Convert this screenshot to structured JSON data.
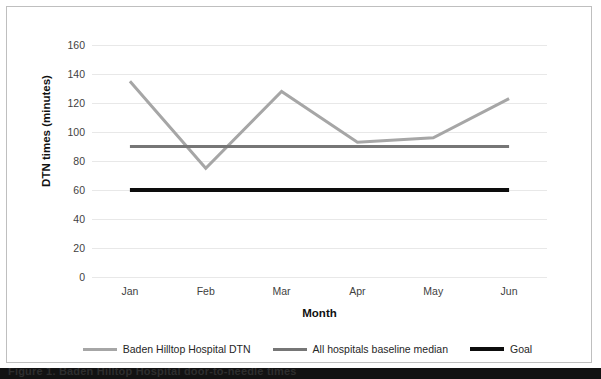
{
  "chart_data": {
    "type": "line",
    "title": "",
    "xlabel": "Month",
    "ylabel": "DTN times (minutes)",
    "categories": [
      "Jan",
      "Feb",
      "Mar",
      "Apr",
      "May",
      "Jun"
    ],
    "ylim": [
      0,
      160
    ],
    "ytick_step": 20,
    "yticks": [
      160,
      140,
      120,
      100,
      80,
      60,
      40,
      20,
      0
    ],
    "grid": "horizontal",
    "legend_position": "bottom",
    "series": [
      {
        "name": "Baden Hilltop Hospital DTN",
        "color": "#a6a6a6",
        "width": 3,
        "values": [
          135,
          75,
          128,
          93,
          96,
          123
        ]
      },
      {
        "name": "All hospitals baseline median",
        "color": "#767676",
        "width": 3,
        "values": [
          90,
          90,
          90,
          90,
          90,
          90
        ]
      },
      {
        "name": "Goal",
        "color": "#0d0d0d",
        "width": 4,
        "values": [
          60,
          60,
          60,
          60,
          60,
          60
        ]
      }
    ]
  },
  "legend": {
    "items": [
      {
        "label": "Baden Hilltop Hospital DTN",
        "color": "#a6a6a6",
        "weight": "normal"
      },
      {
        "label": "All hospitals baseline median",
        "color": "#767676",
        "weight": "normal"
      },
      {
        "label": "Goal",
        "color": "#0d0d0d",
        "weight": "thick"
      }
    ]
  },
  "caption": {
    "text": "Figure 1. Baden Hilltop Hospital door-to-needle times"
  }
}
